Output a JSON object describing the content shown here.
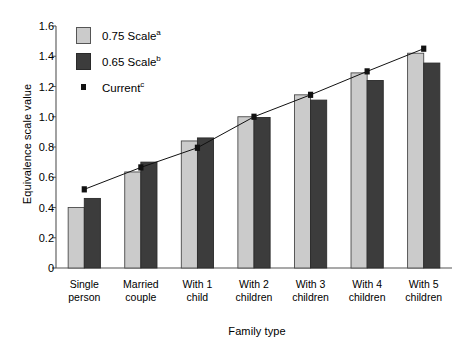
{
  "chart_data": {
    "type": "bar",
    "title": "",
    "xlabel": "Family type",
    "ylabel": "Equivalence scale value",
    "ylim": [
      0,
      1.6
    ],
    "yticks": [
      "0",
      "0.2",
      "0.4",
      "0.6",
      "0.8",
      "1.0",
      "1.2",
      "1.4",
      "1.6"
    ],
    "ytick_values": [
      0,
      0.2,
      0.4,
      0.6,
      0.8,
      1.0,
      1.2,
      1.4,
      1.6
    ],
    "grid": false,
    "legend_position": "upper-left-inside",
    "categories": [
      "Single person",
      "Married couple",
      "With 1 child",
      "With 2 children",
      "With 3 children",
      "With 4 children",
      "With 5 children"
    ],
    "category_lines": [
      [
        "Single",
        "person"
      ],
      [
        "Married",
        "couple"
      ],
      [
        "With 1",
        "child"
      ],
      [
        "With 2",
        "children"
      ],
      [
        "With 3",
        "children"
      ],
      [
        "With 4",
        "children"
      ],
      [
        "With 5",
        "children"
      ]
    ],
    "series": [
      {
        "name": "0.75 Scale",
        "note": "a",
        "kind": "bar",
        "color": "#cbcbcb",
        "values": [
          0.4,
          0.635,
          0.84,
          1.0,
          1.145,
          1.29,
          1.42
        ]
      },
      {
        "name": "0.65 Scale",
        "note": "b",
        "kind": "bar",
        "color": "#3c3c3c",
        "values": [
          0.46,
          0.7,
          0.86,
          0.995,
          1.11,
          1.24,
          1.355
        ]
      },
      {
        "name": "Current",
        "note": "c",
        "kind": "line-marker",
        "color": "#111111",
        "values": [
          0.52,
          0.665,
          0.795,
          1.0,
          1.145,
          1.3,
          1.45
        ]
      }
    ]
  },
  "legend": {
    "items": [
      {
        "label": "0.75 Scale",
        "sup": "a",
        "marker": "light-swatch"
      },
      {
        "label": "0.65 Scale",
        "sup": "b",
        "marker": "dark-swatch"
      },
      {
        "label": "Current",
        "sup": "c",
        "marker": "square-point"
      }
    ]
  },
  "axes": {
    "y_title": "Equivalence scale value",
    "x_title": "Family type"
  }
}
